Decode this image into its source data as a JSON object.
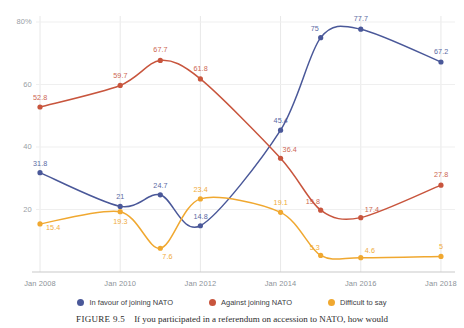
{
  "chart_data": {
    "type": "line",
    "title": "",
    "xlabel": "",
    "ylabel": "",
    "grid": true,
    "legend_position": "bottom",
    "ylim": [
      0,
      80
    ],
    "yticks": [
      "20",
      "40",
      "60",
      "80%"
    ],
    "ytick_values": [
      20,
      40,
      60,
      80
    ],
    "categories": [
      "Jan 2008",
      "Jan 2010",
      "Jan 2012",
      "Jan 2014",
      "Jan 2016",
      "Jan 2018"
    ],
    "x": [
      2008,
      2010,
      2012,
      2014,
      2016,
      2018
    ],
    "series": [
      {
        "name": "In favour of joining NATO",
        "color": "#4a5899",
        "x": [
          2008,
          2010,
          2011,
          2012,
          2014,
          2015,
          2016,
          2018
        ],
        "values": [
          31.8,
          21,
          24.7,
          14.8,
          45.4,
          75,
          77.7,
          67.2
        ],
        "labels": [
          "31.8",
          "21",
          "24.7",
          "14.8",
          "45.4",
          "75",
          "77.7",
          "67.2"
        ]
      },
      {
        "name": "Against joining NATO",
        "color": "#c8553d",
        "x": [
          2008,
          2010,
          2011,
          2012,
          2014,
          2015,
          2016,
          2018
        ],
        "values": [
          52.8,
          59.7,
          67.7,
          61.8,
          36.4,
          19.8,
          17.4,
          27.8
        ],
        "labels": [
          "52.8",
          "59.7",
          "67.7",
          "61.8",
          "36.4",
          "19.8",
          "17.4",
          "27.8"
        ]
      },
      {
        "name": "Difficult to say",
        "color": "#f0a830",
        "x": [
          2008,
          2010,
          2011,
          2012,
          2014,
          2015,
          2016,
          2018
        ],
        "values": [
          15.4,
          19.3,
          7.6,
          23.4,
          19.1,
          5.3,
          4.6,
          5
        ],
        "labels": [
          "15.4",
          "19.3",
          "7.6",
          "23.4",
          "19.1",
          "5.3",
          "4.6",
          "5"
        ]
      }
    ]
  },
  "legend": {
    "items": [
      {
        "label": "In favour of joining NATO",
        "color": "#4a5899"
      },
      {
        "label": "Against joining NATO",
        "color": "#c8553d"
      },
      {
        "label": "Difficult to say",
        "color": "#f0a830"
      }
    ]
  },
  "caption": {
    "figure_number": "FIGURE 9.5",
    "text": "If you participated in a referendum on accession to NATO, how would"
  }
}
